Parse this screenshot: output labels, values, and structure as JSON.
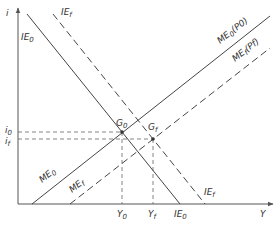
{
  "diagram": {
    "axes": {
      "y_label": "i",
      "x_label": "Y"
    },
    "curves": [
      {
        "id": "IE0",
        "label_main": "IE",
        "label_sub": "0",
        "style": "solid",
        "label_bottom_main": "IE",
        "label_bottom_sub": "0"
      },
      {
        "id": "IEf",
        "label_main": "IE",
        "label_sub": "f",
        "style": "dashed",
        "label_bottom_main": "IE",
        "label_bottom_sub": "f"
      },
      {
        "id": "ME0",
        "label_main": "ME",
        "label_sub": "0",
        "label_suffix": "(P0)",
        "style": "solid",
        "label_bottom_main": "ME",
        "label_bottom_sub": "0"
      },
      {
        "id": "MEf",
        "label_main": "ME",
        "label_sub": "f",
        "label_suffix": "(Pf)",
        "style": "dashed",
        "label_bottom_main": "ME",
        "label_bottom_sub": "f"
      }
    ],
    "points": [
      {
        "id": "G0",
        "label_main": "G",
        "label_sub": "0"
      },
      {
        "id": "Gf",
        "label_main": "G",
        "label_sub": "f"
      }
    ],
    "y_ticks": [
      {
        "main": "i",
        "sub": "0"
      },
      {
        "main": "i",
        "sub": "f"
      }
    ],
    "x_ticks": [
      {
        "main": "Y",
        "sub": "0"
      },
      {
        "main": "Y",
        "sub": "f"
      },
      {
        "main": "IE",
        "sub": "0"
      }
    ]
  }
}
